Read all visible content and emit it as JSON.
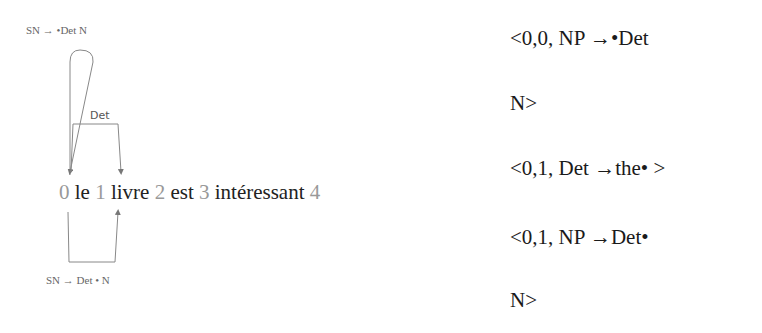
{
  "diagram": {
    "top_rule": "SN →  •Det  N",
    "bottom_rule": "SN → Det  • N",
    "edge_label": "Det",
    "sentence": [
      {
        "pos": "0",
        "word": "le"
      },
      {
        "pos": "1",
        "word": "livre"
      },
      {
        "pos": "2",
        "word": "est"
      },
      {
        "pos": "3",
        "word": "intéressant"
      },
      {
        "pos": "4",
        "word": ""
      }
    ]
  },
  "chart_entries": [
    {
      "line1": "<0,0, NP →•Det",
      "line2": "N>"
    },
    {
      "line1": "<0,1, Det →the• >"
    },
    {
      "line1": "<0,1, NP →Det•",
      "line2": "N>"
    }
  ]
}
